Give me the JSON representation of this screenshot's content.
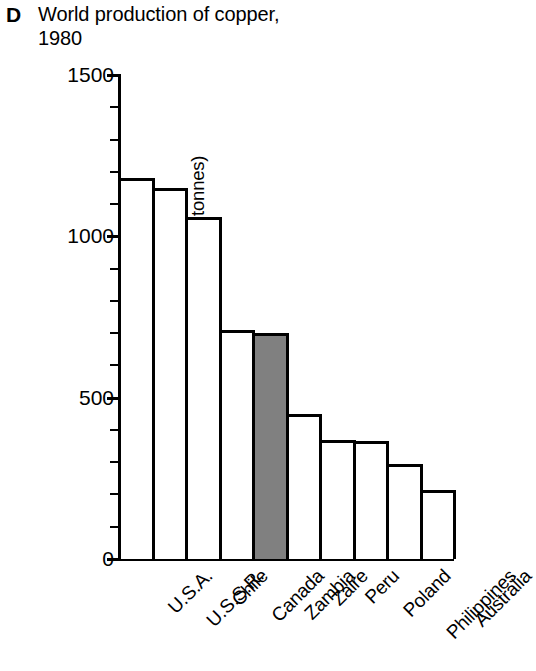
{
  "panel": {
    "letter": "D"
  },
  "header": {
    "title": "World production of copper, 1980"
  },
  "chart_data": {
    "type": "bar",
    "title": "World production of copper, 1980",
    "panel_label": "D",
    "xlabel": "",
    "ylabel": "Annual production, 1980 (thousand tonnes)",
    "ylim": [
      0,
      1500
    ],
    "y_major_ticks": [
      0,
      500,
      1000,
      1500
    ],
    "y_major_tick_labels": [
      "0",
      "500",
      "1000",
      "1500"
    ],
    "y_minor_tick_interval": 100,
    "grid": false,
    "legend": "none",
    "units": "thousand tonnes",
    "categories": [
      "U.S.A.",
      "U.S.S.R.",
      "Chile",
      "Canada",
      "Zambia",
      "Zaire",
      "Peru",
      "Poland",
      "Philippines",
      "Australia"
    ],
    "values": [
      1180,
      1150,
      1060,
      710,
      700,
      450,
      370,
      365,
      295,
      215
    ],
    "highlight_category": "Zambia",
    "highlight_color": "#808080",
    "bar_fill_color": "#ffffff",
    "bar_edge_color": "#000000"
  }
}
